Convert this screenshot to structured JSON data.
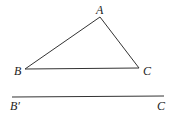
{
  "figure": {
    "triangle": {
      "vertices": {
        "A": {
          "label": "A",
          "x": 100,
          "y": 17
        },
        "B": {
          "label": "B",
          "x": 25,
          "y": 69
        },
        "C": {
          "label": "C",
          "x": 139,
          "y": 68
        }
      }
    },
    "segment": {
      "start_label": "B′",
      "end_label": "C",
      "x1": 12,
      "y1": 97,
      "x2": 164,
      "y2": 96
    },
    "stroke_color": "#333333"
  }
}
